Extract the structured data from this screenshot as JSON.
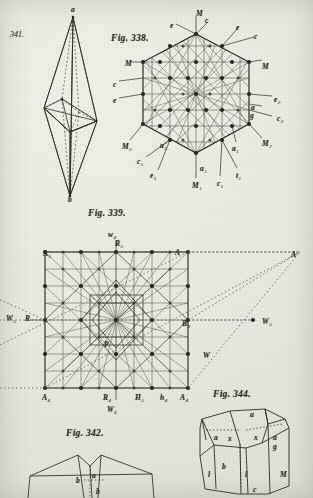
{
  "plate": {
    "title": "Crystallography plate",
    "paper_color": "#e9e9e6",
    "ink_color": "#2b2b28"
  },
  "figures": [
    {
      "id": "fig-341",
      "number": "341.",
      "caption": "341.",
      "type": "bipyramid-perspective",
      "vertex_labels": [
        {
          "text": "a",
          "x": 73,
          "y": 12
        },
        {
          "text": "b",
          "x": 70,
          "y": 196
        }
      ]
    },
    {
      "id": "fig-338",
      "number": "338",
      "caption": "Fig. 338.",
      "type": "hexagonal-lattice-net",
      "labels": [
        {
          "text": "M",
          "sub": "",
          "x": 196,
          "y": 10
        },
        {
          "text": "e",
          "sub": "",
          "x": 170,
          "y": 22
        },
        {
          "text": "c",
          "sub": "",
          "x": 205,
          "y": 17
        },
        {
          "text": "e",
          "sub": "",
          "x": 236,
          "y": 24
        },
        {
          "text": "c",
          "sub": "",
          "x": 254,
          "y": 33
        },
        {
          "text": "M",
          "sub": "",
          "x": 125,
          "y": 60
        },
        {
          "text": "M",
          "sub": "",
          "x": 262,
          "y": 63
        },
        {
          "text": "c",
          "sub": "",
          "x": 113,
          "y": 81
        },
        {
          "text": "e",
          "sub": "",
          "x": 113,
          "y": 97
        },
        {
          "text": "e",
          "sub": "2",
          "x": 274,
          "y": 96
        },
        {
          "text": "a",
          "sub": "",
          "x": 251,
          "y": 104
        },
        {
          "text": "g",
          "sub": "",
          "x": 250,
          "y": 112
        },
        {
          "text": "c",
          "sub": "2",
          "x": 277,
          "y": 115
        },
        {
          "text": "M",
          "sub": "5",
          "x": 122,
          "y": 143
        },
        {
          "text": "M",
          "sub": "2",
          "x": 262,
          "y": 140
        },
        {
          "text": "a",
          "sub": "5",
          "x": 160,
          "y": 142
        },
        {
          "text": "a",
          "sub": "1",
          "x": 232,
          "y": 145
        },
        {
          "text": "c",
          "sub": "5",
          "x": 137,
          "y": 158
        },
        {
          "text": "e",
          "sub": "5",
          "x": 150,
          "y": 172
        },
        {
          "text": "a",
          "sub": "1",
          "x": 200,
          "y": 165
        },
        {
          "text": "M",
          "sub": "1",
          "x": 192,
          "y": 182
        },
        {
          "text": "c",
          "sub": "1",
          "x": 217,
          "y": 180
        },
        {
          "text": "t",
          "sub": "1",
          "x": 236,
          "y": 172
        }
      ]
    },
    {
      "id": "fig-339",
      "number": "339",
      "caption": "Fig. 339.",
      "type": "square-lattice-net",
      "labels": [
        {
          "text": "w",
          "sub": "4",
          "x": 108,
          "y": 231
        },
        {
          "text": "R",
          "sub": "5",
          "x": 115,
          "y": 240
        },
        {
          "text": "A",
          "sub": "5",
          "x": 43,
          "y": 250
        },
        {
          "text": "A",
          "sub": "",
          "x": 175,
          "y": 249
        },
        {
          "text": "A",
          "sub": "",
          "x": 291,
          "y": 251
        },
        {
          "text": "W",
          "sub": "5",
          "x": 6,
          "y": 315
        },
        {
          "text": "R",
          "sub": "",
          "x": 25,
          "y": 315
        },
        {
          "text": "B",
          "sub": "0",
          "x": 182,
          "y": 320
        },
        {
          "text": "W",
          "sub": "5",
          "x": 262,
          "y": 318
        },
        {
          "text": "P",
          "sub": "",
          "x": 104,
          "y": 341
        },
        {
          "text": "W",
          "sub": "",
          "x": 203,
          "y": 352
        },
        {
          "text": "A",
          "sub": "4",
          "x": 42,
          "y": 394
        },
        {
          "text": "R",
          "sub": "4",
          "x": 103,
          "y": 394
        },
        {
          "text": "H",
          "sub": "5",
          "x": 135,
          "y": 394
        },
        {
          "text": "h",
          "sub": "4",
          "x": 160,
          "y": 394
        },
        {
          "text": "A",
          "sub": "4",
          "x": 180,
          "y": 394
        },
        {
          "text": "W",
          "sub": "6",
          "x": 107,
          "y": 406
        }
      ]
    },
    {
      "id": "fig-342",
      "number": "342",
      "caption": "Fig. 342.",
      "type": "crystal-habit",
      "labels": [
        {
          "text": "b",
          "sub": "",
          "x": 76,
          "y": 477
        },
        {
          "text": "a",
          "sub": "",
          "x": 92,
          "y": 472
        },
        {
          "text": "b",
          "sub": "",
          "x": 96,
          "y": 488
        }
      ]
    },
    {
      "id": "fig-344",
      "number": "344",
      "caption": "Fig. 344.",
      "type": "crystal-habit",
      "labels": [
        {
          "text": "a",
          "sub": "",
          "x": 250,
          "y": 411
        },
        {
          "text": "a",
          "sub": "",
          "x": 214,
          "y": 434
        },
        {
          "text": "x",
          "sub": "",
          "x": 228,
          "y": 435
        },
        {
          "text": "x",
          "sub": "",
          "x": 254,
          "y": 434
        },
        {
          "text": "a",
          "sub": "",
          "x": 273,
          "y": 434
        },
        {
          "text": "g",
          "sub": "",
          "x": 273,
          "y": 443
        },
        {
          "text": "b",
          "sub": "",
          "x": 222,
          "y": 463
        },
        {
          "text": "l",
          "sub": "",
          "x": 208,
          "y": 471
        },
        {
          "text": "l",
          "sub": "",
          "x": 245,
          "y": 471
        },
        {
          "text": "M",
          "sub": "",
          "x": 280,
          "y": 471
        },
        {
          "text": "c",
          "sub": "",
          "x": 253,
          "y": 486
        }
      ]
    }
  ]
}
